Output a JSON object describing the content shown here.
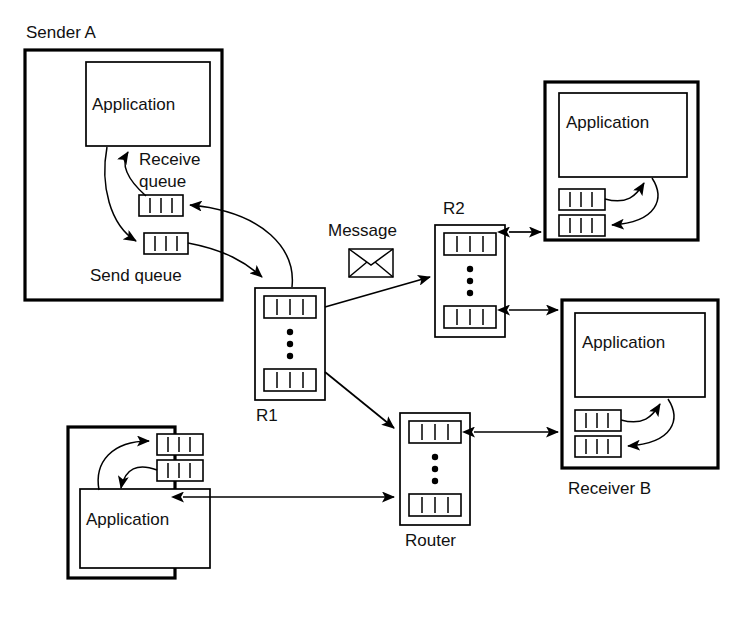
{
  "diagram": {
    "background_color": "#ffffff",
    "line_color": "#000000",
    "text_color": "#111111",
    "width": 743,
    "height": 626
  },
  "labels": {
    "sender_a": "Sender A",
    "receiver_b": "Receiver B",
    "router": "Router",
    "r1": "R1",
    "r2": "R2",
    "message": "Message",
    "receive_queue": "Receive",
    "receive_queue_2": "queue",
    "send_queue": "Send queue",
    "application": "Application"
  },
  "hosts": [
    {
      "id": "sender-a",
      "label": "Sender A",
      "label_position": "top-left",
      "app_label": "Application",
      "queues": [
        {
          "name": "receive-queue",
          "label": "Receive queue",
          "slots": 3
        },
        {
          "name": "send-queue",
          "label": "Send queue",
          "slots": 3
        }
      ]
    },
    {
      "id": "top-right-host",
      "label": "",
      "app_label": "Application",
      "queues": [
        {
          "name": "send-queue",
          "label": "",
          "slots": 3
        },
        {
          "name": "receive-queue",
          "label": "",
          "slots": 3
        }
      ]
    },
    {
      "id": "receiver-b",
      "label": "Receiver B",
      "label_position": "bottom",
      "app_label": "Application",
      "queues": [
        {
          "name": "send-queue",
          "label": "",
          "slots": 3
        },
        {
          "name": "receive-queue",
          "label": "",
          "slots": 3
        }
      ]
    },
    {
      "id": "bottom-left-host",
      "label": "",
      "app_label": "Application",
      "queues": [
        {
          "name": "send-queue",
          "label": "",
          "slots": 3
        },
        {
          "name": "receive-queue",
          "label": "",
          "slots": 3
        }
      ]
    }
  ],
  "routers": [
    {
      "id": "r1",
      "label": "R1",
      "label_position": "bottom-left",
      "queues": 2,
      "slots": 3,
      "ellipsis_dots": 3
    },
    {
      "id": "r2",
      "label": "R2",
      "label_position": "top",
      "queues": 2,
      "slots": 3,
      "ellipsis_dots": 3
    },
    {
      "id": "router",
      "label": "Router",
      "label_position": "bottom",
      "queues": 2,
      "slots": 3,
      "ellipsis_dots": 3
    }
  ],
  "message_icon": {
    "label": "Message",
    "icon": "envelope-icon"
  },
  "connections": [
    {
      "from": "sender-a-send-queue",
      "to": "r1",
      "style": "curved",
      "arrows": "single"
    },
    {
      "from": "r1",
      "to": "sender-a-receive-queue",
      "style": "curved",
      "arrows": "single"
    },
    {
      "from": "r1",
      "to": "r2",
      "style": "straight",
      "arrows": "single"
    },
    {
      "from": "r2",
      "to": "r1",
      "style": "straight",
      "arrows": "single"
    },
    {
      "from": "r1",
      "to": "router",
      "style": "straight",
      "arrows": "single"
    },
    {
      "from": "r2",
      "to": "top-right-host",
      "style": "straight",
      "arrows": "double"
    },
    {
      "from": "r2",
      "to": "receiver-b",
      "style": "straight",
      "arrows": "double"
    },
    {
      "from": "router",
      "to": "receiver-b",
      "style": "straight",
      "arrows": "double"
    },
    {
      "from": "bottom-left-host",
      "to": "router",
      "style": "straight",
      "arrows": "double"
    }
  ]
}
